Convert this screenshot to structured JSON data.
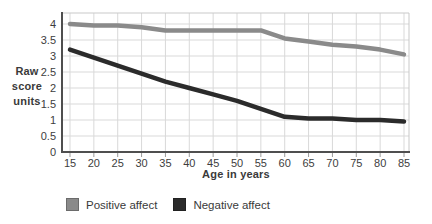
{
  "chart_data": {
    "type": "line",
    "title": "",
    "xlabel": "Age in years",
    "ylabel": "Raw score units",
    "ylabel_multiline": "Raw\nscore\nunits",
    "x": [
      15,
      20,
      25,
      30,
      35,
      40,
      45,
      50,
      55,
      60,
      65,
      70,
      75,
      80,
      85
    ],
    "x_tick_labels": [
      "15",
      "20",
      "25",
      "30",
      "35",
      "40",
      "45",
      "50",
      "55",
      "60",
      "65",
      "70",
      "75",
      "80",
      "85"
    ],
    "y_ticks": [
      0,
      0.5,
      1,
      1.5,
      2,
      2.5,
      3,
      3.5,
      4
    ],
    "y_tick_labels": [
      "0",
      "0.5",
      "1",
      "1.5",
      "2",
      "2.5",
      "3",
      "3.5",
      "4"
    ],
    "xlim": [
      15,
      85
    ],
    "ylim": [
      0,
      4.35
    ],
    "grid": true,
    "legend_position": "bottom-left",
    "series": [
      {
        "name": "Positive affect",
        "color": "#8a8a8a",
        "values": [
          4.0,
          3.95,
          3.95,
          3.9,
          3.8,
          3.8,
          3.8,
          3.8,
          3.8,
          3.55,
          3.45,
          3.35,
          3.3,
          3.2,
          3.05
        ]
      },
      {
        "name": "Negative affect",
        "color": "#2b2b2b",
        "values": [
          3.2,
          2.95,
          2.7,
          2.45,
          2.2,
          2.0,
          1.8,
          1.6,
          1.35,
          1.1,
          1.05,
          1.05,
          1.0,
          1.0,
          0.95
        ]
      }
    ]
  },
  "colors": {
    "background": "#ffffff",
    "grid": "#d9d9d9",
    "frame_light": "#c9c9c9",
    "axis_dark": "#4f4f4f",
    "tick_mark": "#9a9a9a",
    "text": "#3d3d3d",
    "series_positive": "#8a8a8a",
    "series_negative": "#2b2b2b"
  }
}
